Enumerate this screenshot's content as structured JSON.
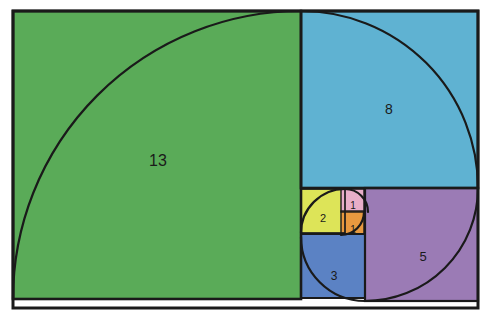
{
  "figure": {
    "background_color": "#ffffff",
    "stroke_color": "#1a1a1a",
    "canvas": {
      "width": 491,
      "height": 325
    },
    "bounds": {
      "x": 13,
      "y": 11,
      "width": 465,
      "height": 297
    }
  },
  "chart_data": {
    "type": "diagram",
    "sequence": [
      1,
      1,
      2,
      3,
      5,
      8,
      13
    ],
    "squares": [
      {
        "label": "13",
        "value": 13,
        "color": "#5aab58",
        "x": 13,
        "y": 11,
        "size": 288,
        "label_x": 158,
        "label_y": 160,
        "arc_from": "bottom-left",
        "arc_to": "top-right"
      },
      {
        "label": "8",
        "value": 8,
        "color": "#5fb2d2",
        "x": 301,
        "y": 11,
        "size": 177,
        "label_x": 389,
        "label_y": 109,
        "arc_from": "top-left",
        "arc_to": "bottom-right"
      },
      {
        "label": "5",
        "value": 5,
        "color": "#9b7bb5",
        "x": 365,
        "y": 188,
        "size": 113,
        "label_x": 423,
        "label_y": 256,
        "arc_from": "top-right",
        "arc_to": "bottom-left"
      },
      {
        "label": "3",
        "value": 3,
        "color": "#5b82c4",
        "x": 301,
        "y": 234,
        "size": 64,
        "label_x": 334,
        "label_y": 276,
        "arc_from": "bottom-right",
        "arc_to": "top-left"
      },
      {
        "label": "2",
        "value": 2,
        "color": "#dde458",
        "x": 301,
        "y": 189,
        "size": 44,
        "label_x": 323,
        "label_y": 218,
        "arc_from": "bottom-left",
        "arc_to": "top-right"
      },
      {
        "label": "1",
        "value": 1,
        "color": "#e8aec8",
        "x": 341,
        "y": 189,
        "size": 23,
        "label_x": 353,
        "label_y": 205,
        "arc_from": "top-left",
        "arc_to": "bottom-right"
      },
      {
        "label": "1",
        "value": 1,
        "color": "#e8993f",
        "x": 341,
        "y": 211,
        "size": 23,
        "label_x": 353,
        "label_y": 229,
        "arc_from": "top-right",
        "arc_to": "bottom-left"
      }
    ],
    "spiral_arcs": [
      {
        "d": "M 13 299 A 288 288 0 0 1 301 11",
        "for": "13"
      },
      {
        "d": "M 301 11 A 177 177 0 0 1 478 188",
        "for": "8"
      },
      {
        "d": "M 478 188 A 113 113 0 0 1 365 301",
        "for": "5"
      },
      {
        "d": "M 365 301 A 64 64 0 0 1 301 237",
        "for": "3"
      },
      {
        "d": "M 301 233 A 44 44 0 0 1 345 189",
        "for": "2"
      },
      {
        "d": "M 345 189 A 23 23 0 0 1 368 212",
        "for": "1-upper"
      },
      {
        "d": "M 364 212 A 23 23 0 0 1 341 235",
        "for": "1-lower"
      }
    ]
  }
}
